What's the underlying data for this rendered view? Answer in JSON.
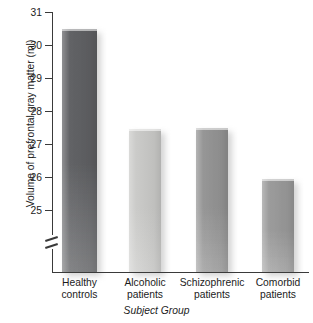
{
  "chart_data": {
    "type": "bar",
    "title": "",
    "xlabel": "Subject Group",
    "ylabel": "Volume of prefrontal gray matter (ml)",
    "categories": [
      "Healthy controls",
      "Alcoholic patients",
      "Schizophrenic patients",
      "Comorbid patients"
    ],
    "category_lines": [
      [
        "Healthy",
        "controls"
      ],
      [
        "Alcoholic",
        "patients"
      ],
      [
        "Schizophrenic",
        "patients"
      ],
      [
        "Comorbid",
        "patients"
      ]
    ],
    "values": [
      30.5,
      27.45,
      27.5,
      25.95
    ],
    "ylim": [
      24.6,
      31.0
    ],
    "yticks": [
      25,
      26,
      27,
      28,
      29,
      30,
      31
    ],
    "ytick_labels": [
      "25",
      "26",
      "27",
      "28",
      "29",
      "30",
      "31"
    ],
    "axis_break": true,
    "axis_break_note": "y-axis broken below 25",
    "grid": false,
    "legend": false,
    "bar_colors": [
      "#5f6063",
      "#cacac8",
      "#949494",
      "#9a9a9a"
    ]
  },
  "axis": {
    "ylabel": "Volume of prefrontal gray matter (ml)",
    "xlabel": "Subject Group"
  }
}
